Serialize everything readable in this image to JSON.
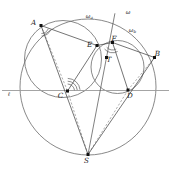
{
  "figure": {
    "canvas": {
      "width": 171,
      "height": 173,
      "background": "#ffffff"
    },
    "colors": {
      "circle_stroke": "#6b6b6b",
      "chord_stroke": "#3a3a3a",
      "dashed_stroke": "#8d8d8d",
      "baseline_stroke": "#9a9a9a",
      "point_fill": "#111111",
      "label_fill": "#1a1a1a",
      "angle_mark": "#5a5a5a"
    },
    "points": [
      {
        "id": "A",
        "label": "A",
        "x": 41.0,
        "y": 25.5,
        "label_dx": -7.5,
        "label_dy": -1.0
      },
      {
        "id": "B",
        "label": "B",
        "x": 154.5,
        "y": 57.5,
        "label_dx": 3.0,
        "label_dy": -1.5
      },
      {
        "id": "C",
        "label": "C",
        "x": 67.5,
        "y": 91.0,
        "label_dx": -7.0,
        "label_dy": 7.0
      },
      {
        "id": "D",
        "label": "D",
        "x": 128.0,
        "y": 90.0,
        "label_dx": 2.0,
        "label_dy": 7.5
      },
      {
        "id": "E",
        "label": "E",
        "x": 97.0,
        "y": 45.5,
        "label_dx": -7.5,
        "label_dy": 1.5
      },
      {
        "id": "F",
        "label": "F",
        "x": 112.5,
        "y": 42.5,
        "label_dx": 1.5,
        "label_dy": -2.0
      },
      {
        "id": "T",
        "label": "T",
        "x": 106.5,
        "y": 57.5,
        "label_dx": 2.5,
        "label_dy": 4.0
      },
      {
        "id": "S",
        "label": "S",
        "x": 88.0,
        "y": 154.5,
        "label_dx": -1.5,
        "label_dy": 8.0
      }
    ],
    "circles": [
      {
        "id": "omega",
        "label": "ω",
        "cx": 88.0,
        "cy": 87.0,
        "r": 68.0,
        "label_x": 128.0,
        "label_y": 14.0
      },
      {
        "id": "omega_a",
        "label": "ω",
        "sub": "a",
        "cx": 63.0,
        "cy": 59.0,
        "r": 38.5,
        "label_x": 88.0,
        "label_y": 17.5
      },
      {
        "id": "omega_b",
        "label": "ω",
        "sub": "b",
        "cx": 117.5,
        "cy": 67.0,
        "r": 26.5,
        "label_x": 131.0,
        "label_y": 31.5
      }
    ],
    "lines": {
      "baseline": {
        "id": "ell",
        "label": "ℓ",
        "y": 90.5,
        "x1": 2.0,
        "x2": 169.0,
        "label_x": 9.0,
        "label_y": 95.5
      },
      "segments": [
        {
          "id": "AE",
          "from": "A",
          "to": "E",
          "style": "solid"
        },
        {
          "id": "EF",
          "from": "E",
          "to": "F",
          "style": "solid"
        },
        {
          "id": "FB",
          "from": "F",
          "to": "B",
          "style": "solid"
        },
        {
          "id": "AC",
          "from": "A",
          "to": "C",
          "style": "dashed"
        },
        {
          "id": "EC",
          "from": "E",
          "to": "C",
          "style": "solid"
        },
        {
          "id": "FD",
          "from": "F",
          "to": "D",
          "style": "solid"
        },
        {
          "id": "BD",
          "from": "B",
          "to": "D",
          "style": "dashed"
        },
        {
          "id": "CS",
          "from": "C",
          "to": "S",
          "style": "dashed"
        },
        {
          "id": "DS",
          "from": "D",
          "to": "S",
          "style": "dashed"
        },
        {
          "id": "AS",
          "from": "A",
          "to": "S",
          "style": "solid"
        },
        {
          "id": "BS",
          "from": "B",
          "to": "S",
          "style": "solid"
        },
        {
          "id": "radical-axis",
          "from": "T",
          "to": "S",
          "style": "solid"
        }
      ]
    },
    "angle_marks": [
      {
        "id": "angle-at-A",
        "vertex": "A",
        "count": 2
      },
      {
        "id": "angle-at-C",
        "vertex": "C",
        "count": 3
      },
      {
        "id": "angle-at-F",
        "vertex": "F",
        "count": 2
      }
    ],
    "labels": {
      "point_A": "A",
      "point_B": "B",
      "point_C": "C",
      "point_D": "D",
      "point_E": "E",
      "point_F": "F",
      "point_T": "T",
      "point_S": "S",
      "circle_omega": "ω",
      "circle_omega_a_base": "ω",
      "circle_omega_a_sub": "a",
      "circle_omega_b_base": "ω",
      "circle_omega_b_sub": "b",
      "line_ell": "ℓ"
    }
  }
}
